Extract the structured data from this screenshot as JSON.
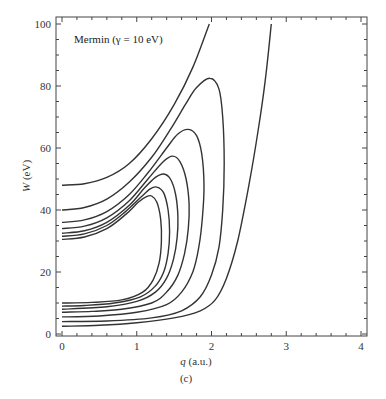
{
  "chart_data": {
    "type": "line",
    "title": "",
    "annotation": "Mermin (γ = 10 eV)",
    "panel_label": "(c)",
    "xlabel_var": "q",
    "xlabel_unit": "(a.u.)",
    "ylabel_var": "W",
    "ylabel_unit": "(eV)",
    "xlim": [
      0,
      4
    ],
    "ylim": [
      0,
      100
    ],
    "x_ticks": [
      0,
      1,
      2,
      3,
      4
    ],
    "y_ticks": [
      0,
      20,
      40,
      60,
      80,
      100
    ],
    "x_tick_labels": [
      "0",
      "1",
      "2",
      "3",
      "4"
    ],
    "y_tick_labels": [
      "0",
      "20",
      "40",
      "60",
      "80",
      "100"
    ],
    "grid": false,
    "legend": null,
    "series": [
      {
        "name": "open-upper (W0=48)",
        "points": [
          [
            0,
            48
          ],
          [
            0.3,
            48.5
          ],
          [
            0.6,
            50.5
          ],
          [
            0.9,
            55
          ],
          [
            1.2,
            63
          ],
          [
            1.5,
            74
          ],
          [
            1.75,
            86
          ],
          [
            1.97,
            100
          ]
        ]
      },
      {
        "name": "loop peak 82.5",
        "points": [
          [
            0,
            40
          ],
          [
            0.3,
            40.8
          ],
          [
            0.6,
            43.5
          ],
          [
            0.9,
            49
          ],
          [
            1.2,
            57
          ],
          [
            1.45,
            66
          ],
          [
            1.65,
            74
          ],
          [
            1.8,
            79.5
          ],
          [
            1.98,
            82.5
          ],
          [
            2.1,
            79
          ],
          [
            2.15,
            70
          ],
          [
            2.17,
            55
          ],
          [
            2.15,
            40
          ],
          [
            2.1,
            28
          ],
          [
            2.0,
            19
          ],
          [
            1.85,
            12
          ],
          [
            1.6,
            7.5
          ],
          [
            1.2,
            5.2
          ],
          [
            0.6,
            4.2
          ],
          [
            0,
            4
          ]
        ]
      },
      {
        "name": "loop peak 66",
        "points": [
          [
            0,
            36
          ],
          [
            0.3,
            36.8
          ],
          [
            0.6,
            39.5
          ],
          [
            0.9,
            45
          ],
          [
            1.15,
            52
          ],
          [
            1.4,
            60
          ],
          [
            1.55,
            64.5
          ],
          [
            1.69,
            66
          ],
          [
            1.8,
            64
          ],
          [
            1.87,
            58
          ],
          [
            1.9,
            48
          ],
          [
            1.88,
            38
          ],
          [
            1.83,
            28
          ],
          [
            1.75,
            20
          ],
          [
            1.6,
            13.5
          ],
          [
            1.4,
            9.5
          ],
          [
            1.0,
            7
          ],
          [
            0.5,
            5.8
          ],
          [
            0,
            5.5
          ]
        ]
      },
      {
        "name": "loop peak 57.4",
        "points": [
          [
            0,
            34
          ],
          [
            0.3,
            34.8
          ],
          [
            0.6,
            37.5
          ],
          [
            0.9,
            43
          ],
          [
            1.15,
            50
          ],
          [
            1.35,
            55.5
          ],
          [
            1.48,
            57.4
          ],
          [
            1.58,
            55.5
          ],
          [
            1.66,
            50
          ],
          [
            1.7,
            42
          ],
          [
            1.69,
            34
          ],
          [
            1.64,
            26
          ],
          [
            1.55,
            19
          ],
          [
            1.4,
            13.5
          ],
          [
            1.2,
            10
          ],
          [
            0.8,
            8
          ],
          [
            0.4,
            7.3
          ],
          [
            0,
            7
          ]
        ]
      },
      {
        "name": "loop peak 51.6",
        "points": [
          [
            0,
            32.5
          ],
          [
            0.3,
            33.3
          ],
          [
            0.6,
            36
          ],
          [
            0.9,
            41.5
          ],
          [
            1.1,
            47
          ],
          [
            1.25,
            50.5
          ],
          [
            1.36,
            51.6
          ],
          [
            1.45,
            50
          ],
          [
            1.52,
            45
          ],
          [
            1.55,
            38
          ],
          [
            1.54,
            31
          ],
          [
            1.49,
            24
          ],
          [
            1.4,
            18
          ],
          [
            1.25,
            13.5
          ],
          [
            1.0,
            10.5
          ],
          [
            0.6,
            8.8
          ],
          [
            0,
            8
          ]
        ]
      },
      {
        "name": "loop peak 47.4",
        "points": [
          [
            0,
            31.5
          ],
          [
            0.3,
            32.3
          ],
          [
            0.6,
            35
          ],
          [
            0.85,
            39.5
          ],
          [
            1.05,
            44
          ],
          [
            1.18,
            46.8
          ],
          [
            1.27,
            47.4
          ],
          [
            1.36,
            45.5
          ],
          [
            1.42,
            40
          ],
          [
            1.44,
            33
          ],
          [
            1.42,
            26
          ],
          [
            1.36,
            20
          ],
          [
            1.25,
            15.5
          ],
          [
            1.05,
            12
          ],
          [
            0.7,
            10
          ],
          [
            0.3,
            9.2
          ],
          [
            0,
            9
          ]
        ]
      },
      {
        "name": "loop peak 44.5",
        "points": [
          [
            0,
            30.5
          ],
          [
            0.3,
            31.3
          ],
          [
            0.6,
            34
          ],
          [
            0.85,
            38.5
          ],
          [
            1.02,
            42.5
          ],
          [
            1.13,
            44.3
          ],
          [
            1.2,
            44.5
          ],
          [
            1.27,
            42.5
          ],
          [
            1.32,
            37
          ],
          [
            1.33,
            30
          ],
          [
            1.3,
            23
          ],
          [
            1.22,
            17.5
          ],
          [
            1.08,
            13.5
          ],
          [
            0.8,
            11
          ],
          [
            0.4,
            10.2
          ],
          [
            0,
            10
          ]
        ]
      },
      {
        "name": "open-lower (W0=2.5)",
        "points": [
          [
            0,
            2.5
          ],
          [
            0.5,
            2.8
          ],
          [
            1.0,
            3.6
          ],
          [
            1.5,
            5.2
          ],
          [
            1.85,
            7.5
          ],
          [
            2.05,
            11
          ],
          [
            2.2,
            18
          ],
          [
            2.35,
            30
          ],
          [
            2.5,
            48
          ],
          [
            2.62,
            65
          ],
          [
            2.72,
            82
          ],
          [
            2.8,
            100
          ]
        ]
      }
    ]
  }
}
